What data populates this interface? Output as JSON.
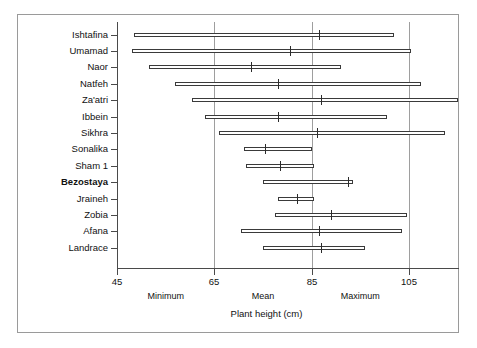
{
  "chart_data": {
    "type": "bar",
    "orientation": "horizontal",
    "title": "",
    "subtitle": "",
    "xlabel": "Plant height (cm)",
    "ylabel": "",
    "xlim": [
      45,
      117
    ],
    "xticks": [
      45,
      65,
      85,
      105
    ],
    "xticklabels": [
      "45",
      "65",
      "85",
      "105"
    ],
    "grid": "vertical gridlines at 65, 85, 105",
    "legend": "none",
    "zone_labels": [
      "Minimum",
      "Mean",
      "Maximum"
    ],
    "categories": [
      "Ishtafina",
      "Umamad",
      "Naor",
      "Natfeh",
      "Za'atri",
      "Ibbein",
      "Sikhra",
      "Sonalika",
      "Sham 1",
      "Bezostaya",
      "Jraineh",
      "Zobia",
      "Afana",
      "Landrace"
    ],
    "emphasized_category": "Bezostaya",
    "series": [
      {
        "name": "Minimum",
        "values": [
          48.5,
          48.0,
          51.5,
          57.0,
          60.5,
          63.0,
          66.0,
          71.0,
          71.5,
          75.0,
          78.0,
          77.5,
          70.5,
          75.0
        ]
      },
      {
        "name": "Mean",
        "values": [
          86.5,
          80.5,
          72.5,
          78.0,
          87.0,
          78.0,
          86.0,
          75.5,
          78.5,
          92.5,
          82.0,
          89.0,
          86.5,
          87.0
        ]
      },
      {
        "name": "Maximum",
        "values": [
          102.0,
          105.5,
          91.0,
          107.5,
          115.0,
          100.5,
          112.5,
          85.0,
          85.5,
          93.5,
          85.5,
          104.5,
          103.5,
          96.0
        ]
      }
    ],
    "rows": [
      {
        "label": "Ishtafina",
        "min": 48.5,
        "mean": 86.5,
        "max": 102.0,
        "bold": false
      },
      {
        "label": "Umamad",
        "min": 48.0,
        "mean": 80.5,
        "max": 105.5,
        "bold": false
      },
      {
        "label": "Naor",
        "min": 51.5,
        "mean": 72.5,
        "max": 91.0,
        "bold": false
      },
      {
        "label": "Natfeh",
        "min": 57.0,
        "mean": 78.0,
        "max": 107.5,
        "bold": false
      },
      {
        "label": "Za'atri",
        "min": 60.5,
        "mean": 87.0,
        "max": 115.0,
        "bold": false
      },
      {
        "label": "Ibbein",
        "min": 63.0,
        "mean": 78.0,
        "max": 100.5,
        "bold": false
      },
      {
        "label": "Sikhra",
        "min": 66.0,
        "mean": 86.0,
        "max": 112.5,
        "bold": false
      },
      {
        "label": "Sonalika",
        "min": 71.0,
        "mean": 75.5,
        "max": 85.0,
        "bold": false
      },
      {
        "label": "Sham 1",
        "min": 71.5,
        "mean": 78.5,
        "max": 85.5,
        "bold": false
      },
      {
        "label": "Bezostaya",
        "min": 75.0,
        "mean": 92.5,
        "max": 93.5,
        "bold": true
      },
      {
        "label": "Jraineh",
        "min": 78.0,
        "mean": 82.0,
        "max": 85.5,
        "bold": false
      },
      {
        "label": "Zobia",
        "min": 77.5,
        "mean": 89.0,
        "max": 104.5,
        "bold": false
      },
      {
        "label": "Afana",
        "min": 70.5,
        "mean": 86.5,
        "max": 103.5,
        "bold": false
      },
      {
        "label": "Landrace",
        "min": 75.0,
        "mean": 87.0,
        "max": 96.0,
        "bold": false
      }
    ]
  },
  "colors": {
    "background": "#ffffff",
    "axis": "#4a4a4a",
    "grid": "#9e9e9e",
    "bar_outline": "#3a3a3a",
    "mean_tick": "#2b2b2b",
    "frame": "#9a9a9a",
    "text": "#111111"
  }
}
